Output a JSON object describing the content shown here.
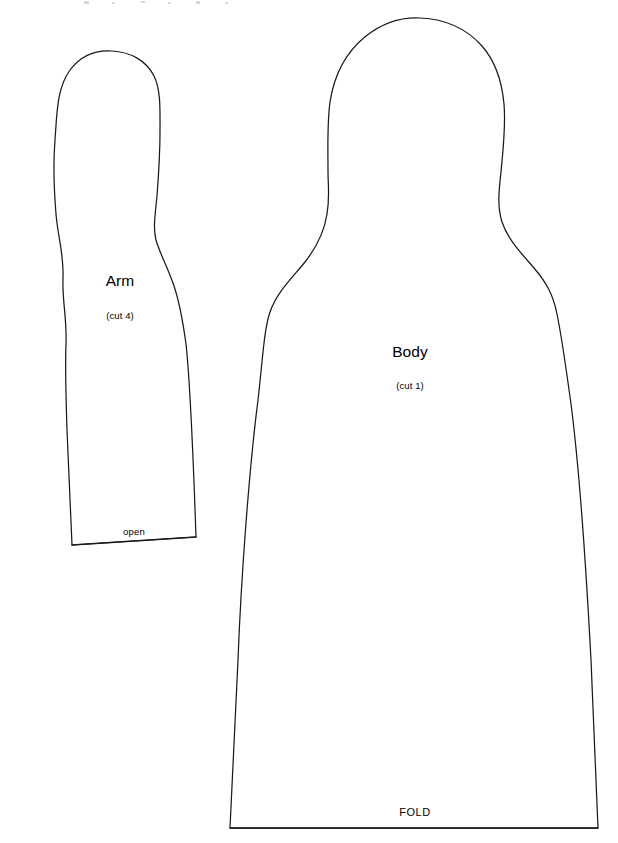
{
  "document": {
    "kind": "sewing-pattern-sheet",
    "background_color": "#ffffff",
    "ink_color": "#1a1a1a",
    "width": 618,
    "height": 843
  },
  "pieces": [
    {
      "id": "arm",
      "title": "Arm",
      "cut_note": "(cut 4)",
      "edge_label": "open",
      "edge_label_position": "bottom"
    },
    {
      "id": "body",
      "title": "Body",
      "cut_note": "(cut 1)",
      "edge_label": "FOLD",
      "edge_label_position": "bottom"
    }
  ],
  "arm": {
    "title": "Arm",
    "cut_note": "(cut 4)",
    "open_label": "open"
  },
  "body": {
    "title": "Body",
    "cut_note": "(cut 1)",
    "fold_label": "FOLD"
  }
}
